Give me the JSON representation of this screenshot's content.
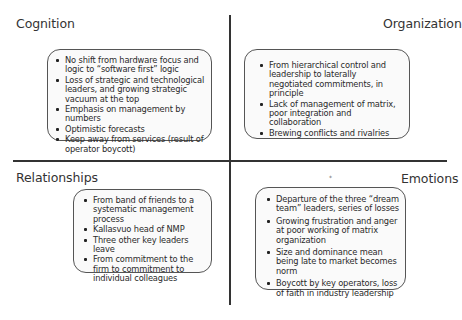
{
  "quadrants": {
    "cognition": {
      "title": "Cognition",
      "items": [
        "No shift from hardware focus and logic to “software first” logic",
        "Loss of strategic and technological leaders, and growing strategic vacuum at the top",
        "Emphasis on management by numbers",
        "Optimistic forecasts",
        "Keep away from services (result of operator boycott)"
      ]
    },
    "organization": {
      "title": "Organization",
      "items": [
        "From hierarchical control and leadership to laterally negotiated commitments, in principle",
        "Lack of management of matrix, poor integration and collaboration",
        "Brewing conflicts and rivalries"
      ]
    },
    "relationships": {
      "title": "Relationships",
      "items": [
        "From band of friends to a systematic management process",
        "Kallasvuo head of NMP",
        "Three other key leaders leave",
        "From commitment to the firm to commitment to individual colleagues"
      ]
    },
    "emotions": {
      "title": "Emotions",
      "items": [
        "Departure of the three “dream team” leaders, series of losses",
        "Growing frustration and anger at poor working of matrix organization",
        "Size and dominance mean being late to market becomes norm",
        "Boycott by key operators, loss of faith in industry leadership"
      ]
    }
  },
  "artifact_mark": "*",
  "colors": {
    "axis": "#333333",
    "box_border": "#555555",
    "text": "#2a2a2a"
  }
}
